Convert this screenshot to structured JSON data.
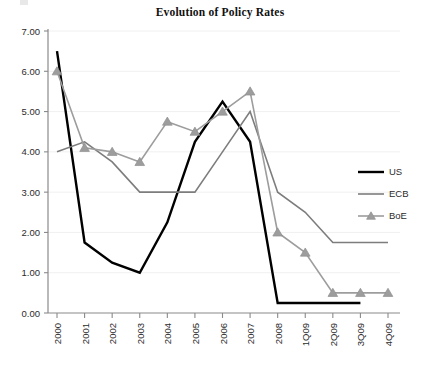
{
  "chart_data": {
    "type": "line",
    "title": "Evolution of Policy Rates",
    "xlabel": "",
    "ylabel": "",
    "ylim": [
      0.0,
      7.0
    ],
    "yticks": [
      "0.00",
      "1.00",
      "2.00",
      "3.00",
      "4.00",
      "5.00",
      "6.00",
      "7.00"
    ],
    "ytick_values": [
      0.0,
      1.0,
      2.0,
      3.0,
      4.0,
      5.0,
      6.0,
      7.0
    ],
    "grid": true,
    "legend_position": "right",
    "categories": [
      "2000",
      "2001",
      "2002",
      "2003",
      "2004",
      "2005",
      "2006",
      "2007",
      "2008",
      "1Q09",
      "2Q09",
      "3Q09",
      "4Q09"
    ],
    "series": [
      {
        "name": "US",
        "color": "#000000",
        "marker": "none",
        "width": 2.4,
        "values": [
          6.5,
          1.75,
          1.25,
          1.0,
          2.25,
          4.25,
          5.25,
          4.25,
          0.25,
          0.25,
          0.25,
          0.25,
          0.25
        ]
      },
      {
        "name": "ECB",
        "color": "#7d7d7d",
        "marker": "none",
        "width": 1.6,
        "values": [
          4.0,
          4.25,
          3.75,
          3.0,
          3.0,
          3.0,
          4.0,
          5.0,
          3.0,
          2.5,
          1.75,
          1.75,
          1.75
        ]
      },
      {
        "name": "BoE",
        "color": "#9d9d9d",
        "marker": "triangle",
        "width": 1.6,
        "values": [
          6.0,
          4.1,
          4.0,
          3.75,
          4.75,
          4.5,
          5.0,
          5.5,
          2.0,
          1.5,
          0.5,
          0.5,
          0.5
        ]
      }
    ]
  },
  "legend": {
    "items": [
      {
        "label": "US"
      },
      {
        "label": "ECB"
      },
      {
        "label": "BoE"
      }
    ]
  },
  "colors": {
    "us": "#000000",
    "ecb": "#7d7d7d",
    "boe": "#9d9d9d",
    "axis": "#8a8a8a",
    "grid": "#f0f0f0",
    "text": "#2b2b2b"
  }
}
